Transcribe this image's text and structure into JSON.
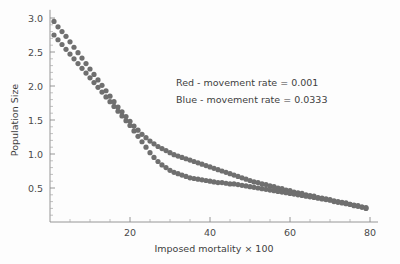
{
  "chart_data": {
    "type": "scatter",
    "title": "",
    "xlabel": "Imposed mortality × 100",
    "ylabel": "Population Size",
    "xlim": [
      0,
      82
    ],
    "ylim": [
      0,
      3.15
    ],
    "grid": false,
    "legend_position": "upper-right-inside",
    "x_ticks_major": [
      20,
      40,
      60,
      80
    ],
    "x_tick_labels": [
      "20",
      "40",
      "60",
      "80"
    ],
    "x_ticks_minor": [
      5,
      10,
      15,
      25,
      30,
      35,
      45,
      50,
      55,
      65,
      70,
      75
    ],
    "y_ticks_major": [
      0.5,
      1.0,
      1.5,
      2.0,
      2.5,
      3.0
    ],
    "y_tick_labels": [
      "0.5",
      "1.0",
      "1.5",
      "2.0",
      "2.5",
      "3.0"
    ],
    "y_ticks_minor": [
      0.1,
      0.2,
      0.3,
      0.4,
      0.6,
      0.7,
      0.8,
      0.9,
      1.1,
      1.2,
      1.3,
      1.4,
      1.6,
      1.7,
      1.8,
      1.9,
      2.1,
      2.2,
      2.3,
      2.4,
      2.6,
      2.7,
      2.8,
      2.9
    ],
    "marker_size": 2.6,
    "series": [
      {
        "name": "Red - movement rate = 0.001",
        "legend_label": "Red - movement rate = 0.001",
        "movement_rate": 0.001,
        "color": "#6f6f6f",
        "points": [
          [
            1.0,
            2.95
          ],
          [
            2.0,
            2.87
          ],
          [
            3.0,
            2.8
          ],
          [
            4.0,
            2.73
          ],
          [
            5.0,
            2.65
          ],
          [
            6.0,
            2.57
          ],
          [
            7.0,
            2.49
          ],
          [
            8.0,
            2.41
          ],
          [
            9.0,
            2.33
          ],
          [
            10.0,
            2.25
          ],
          [
            11.0,
            2.17
          ],
          [
            12.0,
            2.09
          ],
          [
            13.0,
            2.01
          ],
          [
            14.0,
            1.93
          ],
          [
            15.0,
            1.85
          ],
          [
            16.0,
            1.77
          ],
          [
            17.0,
            1.69
          ],
          [
            18.0,
            1.62
          ],
          [
            19.0,
            1.55
          ],
          [
            20.0,
            1.48
          ],
          [
            21.0,
            1.41
          ],
          [
            22.0,
            1.35
          ],
          [
            23.0,
            1.29
          ],
          [
            24.0,
            1.24
          ],
          [
            25.0,
            1.19
          ],
          [
            26.0,
            1.15
          ],
          [
            27.0,
            1.11
          ],
          [
            28.0,
            1.08
          ],
          [
            29.0,
            1.05
          ],
          [
            30.0,
            1.02
          ],
          [
            31.0,
            0.99
          ],
          [
            32.0,
            0.97
          ],
          [
            33.0,
            0.95
          ],
          [
            34.0,
            0.93
          ],
          [
            35.0,
            0.91
          ],
          [
            36.0,
            0.89
          ],
          [
            37.0,
            0.87
          ],
          [
            38.0,
            0.85
          ],
          [
            39.0,
            0.83
          ],
          [
            40.0,
            0.81
          ],
          [
            41.0,
            0.79
          ],
          [
            42.0,
            0.77
          ],
          [
            43.0,
            0.75
          ],
          [
            44.0,
            0.73
          ],
          [
            45.0,
            0.71
          ],
          [
            46.0,
            0.69
          ],
          [
            47.0,
            0.67
          ],
          [
            48.0,
            0.65
          ],
          [
            49.0,
            0.63
          ],
          [
            50.0,
            0.61
          ],
          [
            51.0,
            0.59
          ],
          [
            52.0,
            0.58
          ],
          [
            53.0,
            0.56
          ],
          [
            54.0,
            0.55
          ],
          [
            55.0,
            0.53
          ],
          [
            56.0,
            0.52
          ],
          [
            57.0,
            0.5
          ],
          [
            58.0,
            0.49
          ],
          [
            59.0,
            0.47
          ],
          [
            60.0,
            0.46
          ],
          [
            61.0,
            0.44
          ],
          [
            62.0,
            0.43
          ],
          [
            63.0,
            0.42
          ],
          [
            64.0,
            0.4
          ],
          [
            65.0,
            0.39
          ],
          [
            66.0,
            0.38
          ],
          [
            67.0,
            0.36
          ],
          [
            68.0,
            0.35
          ],
          [
            69.0,
            0.34
          ],
          [
            70.0,
            0.33
          ],
          [
            71.0,
            0.31
          ],
          [
            72.0,
            0.3
          ],
          [
            73.0,
            0.29
          ],
          [
            74.0,
            0.28
          ],
          [
            75.0,
            0.26
          ],
          [
            76.0,
            0.25
          ],
          [
            77.0,
            0.24
          ],
          [
            78.0,
            0.22
          ],
          [
            79.0,
            0.21
          ]
        ]
      },
      {
        "name": "Blue - movement rate = 0.0333",
        "legend_label": "Blue - movement rate = 0.0333",
        "movement_rate": 0.0333,
        "color": "#6f6f6f",
        "points": [
          [
            1.0,
            2.75
          ],
          [
            2.0,
            2.68
          ],
          [
            3.0,
            2.61
          ],
          [
            4.0,
            2.54
          ],
          [
            5.0,
            2.47
          ],
          [
            6.0,
            2.4
          ],
          [
            7.0,
            2.33
          ],
          [
            8.0,
            2.26
          ],
          [
            9.0,
            2.19
          ],
          [
            10.0,
            2.12
          ],
          [
            11.0,
            2.05
          ],
          [
            12.0,
            1.98
          ],
          [
            13.0,
            1.91
          ],
          [
            14.0,
            1.84
          ],
          [
            15.0,
            1.77
          ],
          [
            16.0,
            1.7
          ],
          [
            17.0,
            1.63
          ],
          [
            18.0,
            1.56
          ],
          [
            19.0,
            1.49
          ],
          [
            20.0,
            1.42
          ],
          [
            21.0,
            1.34
          ],
          [
            22.0,
            1.26
          ],
          [
            23.0,
            1.18
          ],
          [
            24.0,
            1.1
          ],
          [
            25.0,
            1.02
          ],
          [
            26.0,
            0.95
          ],
          [
            27.0,
            0.89
          ],
          [
            28.0,
            0.84
          ],
          [
            29.0,
            0.8
          ],
          [
            30.0,
            0.76
          ],
          [
            31.0,
            0.73
          ],
          [
            32.0,
            0.71
          ],
          [
            33.0,
            0.69
          ],
          [
            34.0,
            0.67
          ],
          [
            35.0,
            0.65
          ],
          [
            36.0,
            0.64
          ],
          [
            37.0,
            0.63
          ],
          [
            38.0,
            0.62
          ],
          [
            39.0,
            0.61
          ],
          [
            40.0,
            0.6
          ],
          [
            41.0,
            0.59
          ],
          [
            42.0,
            0.58
          ],
          [
            43.0,
            0.58
          ],
          [
            44.0,
            0.57
          ],
          [
            45.0,
            0.56
          ],
          [
            46.0,
            0.56
          ],
          [
            47.0,
            0.55
          ],
          [
            48.0,
            0.54
          ],
          [
            49.0,
            0.53
          ],
          [
            50.0,
            0.52
          ],
          [
            51.0,
            0.51
          ],
          [
            52.0,
            0.5
          ],
          [
            53.0,
            0.49
          ],
          [
            54.0,
            0.48
          ],
          [
            55.0,
            0.47
          ],
          [
            56.0,
            0.46
          ],
          [
            57.0,
            0.45
          ],
          [
            58.0,
            0.44
          ],
          [
            59.0,
            0.43
          ],
          [
            60.0,
            0.42
          ],
          [
            61.0,
            0.41
          ],
          [
            62.0,
            0.4
          ],
          [
            63.0,
            0.39
          ],
          [
            64.0,
            0.38
          ],
          [
            65.0,
            0.37
          ],
          [
            66.0,
            0.36
          ],
          [
            67.0,
            0.35
          ],
          [
            68.0,
            0.34
          ],
          [
            69.0,
            0.33
          ],
          [
            70.0,
            0.32
          ],
          [
            71.0,
            0.3
          ],
          [
            72.0,
            0.29
          ],
          [
            73.0,
            0.28
          ],
          [
            74.0,
            0.27
          ],
          [
            75.0,
            0.26
          ],
          [
            76.0,
            0.24
          ],
          [
            77.0,
            0.23
          ],
          [
            78.0,
            0.22
          ],
          [
            79.0,
            0.2
          ]
        ]
      }
    ],
    "legend_entries": [
      "Red - movement rate = 0.001",
      "Blue - movement rate = 0.0333"
    ]
  }
}
